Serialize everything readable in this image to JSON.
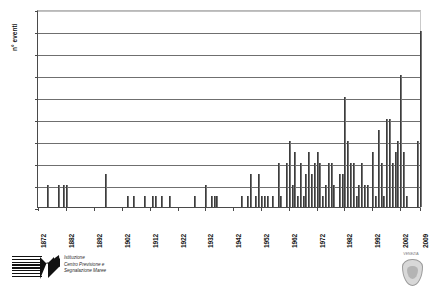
{
  "chart_data": {
    "type": "bar",
    "title": "",
    "subtitle": "",
    "xlabel": "",
    "ylabel": "n° eventi",
    "ylim": [
      0,
      18
    ],
    "ytick_step": 2,
    "yticks": [
      0,
      2,
      4,
      6,
      8,
      10,
      12,
      14,
      16,
      18
    ],
    "xlim": [
      1872,
      2009
    ],
    "xticks": [
      1872,
      1882,
      1892,
      1902,
      1912,
      1922,
      1932,
      1942,
      1952,
      1962,
      1972,
      1982,
      1992,
      2002,
      2009
    ],
    "xtick_labels": [
      "1872",
      "1882",
      "1892",
      "1902",
      "1912",
      "1922",
      "1932",
      "1942",
      "1952",
      "1962",
      "1972",
      "1982",
      "1992",
      "2002",
      "2009"
    ],
    "grid": "horizontal",
    "legend": "none",
    "bar_color": "#585858",
    "axis_color": "#4a4a4a",
    "grid_color": "#6f6f6f",
    "categories": [
      1872,
      1873,
      1874,
      1875,
      1876,
      1877,
      1878,
      1879,
      1880,
      1881,
      1882,
      1883,
      1884,
      1885,
      1886,
      1887,
      1888,
      1889,
      1890,
      1891,
      1892,
      1893,
      1894,
      1895,
      1896,
      1897,
      1898,
      1899,
      1900,
      1901,
      1902,
      1903,
      1904,
      1905,
      1906,
      1907,
      1908,
      1909,
      1910,
      1911,
      1912,
      1913,
      1914,
      1915,
      1916,
      1917,
      1918,
      1919,
      1920,
      1921,
      1922,
      1923,
      1924,
      1925,
      1926,
      1927,
      1928,
      1929,
      1930,
      1931,
      1932,
      1933,
      1934,
      1935,
      1936,
      1937,
      1938,
      1939,
      1940,
      1941,
      1942,
      1943,
      1944,
      1945,
      1946,
      1947,
      1948,
      1949,
      1950,
      1951,
      1952,
      1953,
      1954,
      1955,
      1956,
      1957,
      1958,
      1959,
      1960,
      1961,
      1962,
      1963,
      1964,
      1965,
      1966,
      1967,
      1968,
      1969,
      1970,
      1971,
      1972,
      1973,
      1974,
      1975,
      1976,
      1977,
      1978,
      1979,
      1980,
      1981,
      1982,
      1983,
      1984,
      1985,
      1986,
      1987,
      1988,
      1989,
      1990,
      1991,
      1992,
      1993,
      1994,
      1995,
      1996,
      1997,
      1998,
      1999,
      2000,
      2001,
      2002,
      2003,
      2004,
      2005,
      2006,
      2007,
      2008,
      2009
    ],
    "values": [
      0,
      0,
      0,
      2,
      0,
      0,
      0,
      2,
      0,
      2,
      2,
      0,
      0,
      0,
      0,
      0,
      0,
      0,
      0,
      0,
      0,
      0,
      0,
      0,
      3,
      0,
      0,
      0,
      0,
      0,
      0,
      0,
      1,
      0,
      1,
      0,
      0,
      0,
      1,
      0,
      0,
      1,
      1,
      0,
      1,
      0,
      0,
      1,
      0,
      0,
      0,
      0,
      0,
      0,
      0,
      0,
      1,
      0,
      0,
      0,
      2,
      0,
      1,
      1,
      1,
      0,
      0,
      0,
      0,
      0,
      0,
      0,
      0,
      1,
      0,
      1,
      3,
      0,
      1,
      3,
      1,
      1,
      1,
      0,
      1,
      0,
      4,
      1,
      0,
      4,
      6,
      2,
      5,
      1,
      4,
      1,
      3,
      5,
      3,
      4,
      5,
      4,
      1,
      2,
      4,
      4,
      2,
      0,
      3,
      3,
      10,
      6,
      4,
      4,
      1,
      2,
      4,
      2,
      2,
      0,
      5,
      1,
      7,
      4,
      1,
      8,
      8,
      4,
      5,
      6,
      12,
      5,
      1,
      0,
      0,
      0,
      6,
      16
    ]
  },
  "footer": {
    "logo_left": {
      "name": "istituzione-centro-previsione-segnalazione-maree",
      "lines": [
        "Istituzione",
        "Centro Previsione e",
        "Segnalazione Maree"
      ]
    },
    "logo_right": {
      "name": "comune-di-venezia-crest",
      "caption": "VENEZIA"
    }
  }
}
